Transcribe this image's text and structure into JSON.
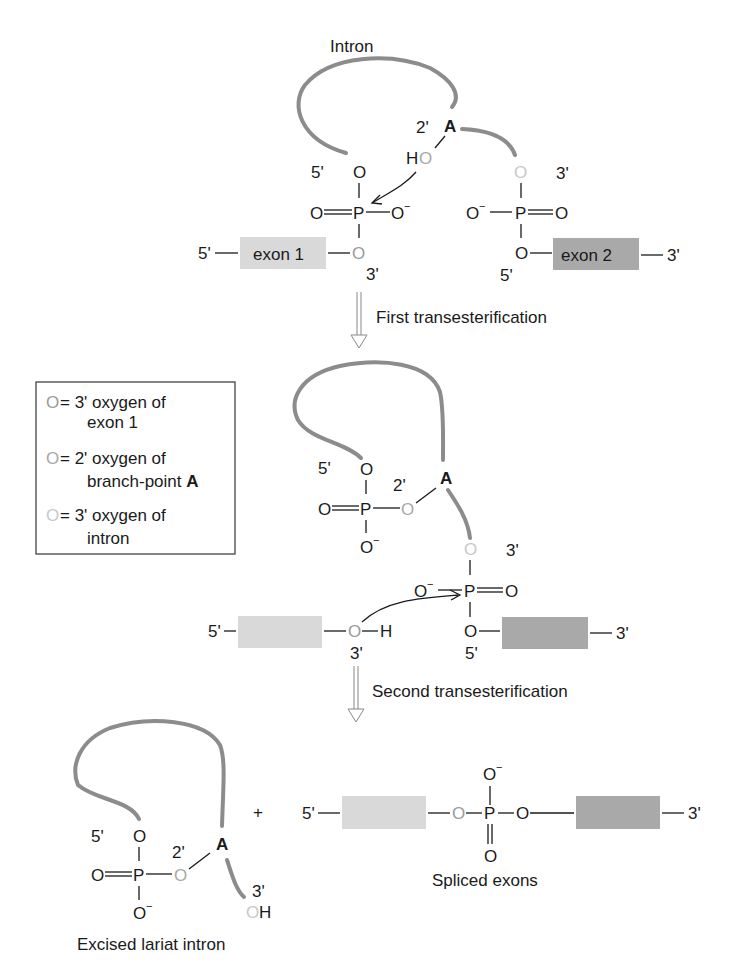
{
  "colors": {
    "strand": "#8c8c8c",
    "exon1_fill": "#d9d9d9",
    "exon2_fill": "#a9a9a9",
    "oxygen_exon1": "#9a9a9a",
    "oxygen_branch_A": "#a8a8a8",
    "oxygen_intron": "#c8c8c8",
    "text": "#1a1a1a"
  },
  "stage1": {
    "intron_label": "Intron",
    "branch_point": "A",
    "two_prime": "2'",
    "ho": "H",
    "five_prime_intron": "5'",
    "three_prime_intron": "3'",
    "exon1_label": "exon 1",
    "exon2_label": "exon 2",
    "exon1_5prime": "5'",
    "exon1_3prime": "3'",
    "exon2_5prime": "5'",
    "exon2_3prime": "3'",
    "O": "O",
    "P": "P",
    "O_minus": "O"
  },
  "step1": {
    "label": "First transesterification"
  },
  "legend": {
    "items": [
      {
        "symbol": "O",
        "text_line1": "= 3' oxygen of",
        "text_line2": "exon 1"
      },
      {
        "symbol": "O",
        "text_line1": "= 2' oxygen of",
        "text_line2": "branch-point ",
        "bold": "A"
      },
      {
        "symbol": "O",
        "text_line1": "= 3' oxygen of",
        "text_line2": "intron"
      }
    ]
  },
  "stage2": {
    "branch_point": "A",
    "two_prime": "2'",
    "five_prime": "5'",
    "three_prime_intron": "3'",
    "exon1_5prime": "5'",
    "exon1_3prime": "3'",
    "exon2_5prime": "5'",
    "exon2_3prime": "3'",
    "H": "H"
  },
  "step2": {
    "label": "Second transesterification"
  },
  "stage3": {
    "plus": "+",
    "branch_point": "A",
    "two_prime": "2'",
    "five_prime": "5'",
    "three_prime": "3'",
    "H": "H",
    "lariat_caption": "Excised lariat intron",
    "spliced_caption": "Spliced exons",
    "spliced_5prime": "5'",
    "spliced_3prime": "3'"
  }
}
